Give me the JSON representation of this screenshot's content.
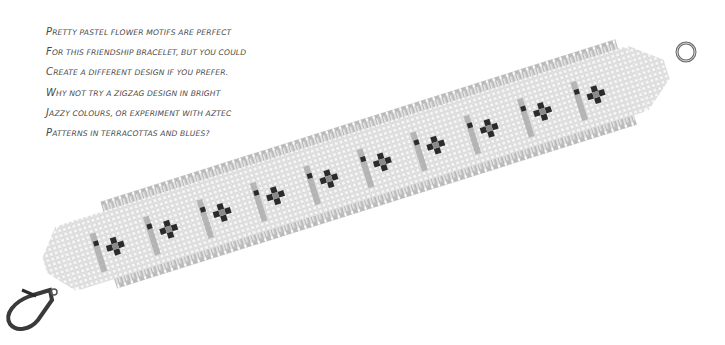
{
  "caption": {
    "lines": [
      "Pretty pastel flower motifs are perfect",
      "for this friendship bracelet, but you could",
      "create a different design if you prefer.",
      "Why not try a zigzag design in bright",
      "jazzy colours, or experiment with Aztec",
      "patterns in terracottas and blues?"
    ]
  },
  "photo": {
    "subject": "beaded friendship bracelet with flower motifs",
    "motif_count": 10,
    "colors": {
      "base_beads": "#e6e6e6",
      "fringe_beads": "#b9b9b9",
      "stripe_beads": "#a8a8a8",
      "flower_beads": "#2a2a2a",
      "clasp_metal": "#555555"
    }
  }
}
